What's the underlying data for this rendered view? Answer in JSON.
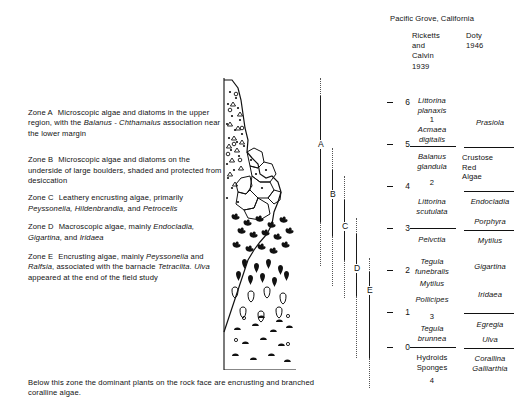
{
  "figure": {
    "footnote": "Below this zone the dominant plants on the rock face are encrusting and branched coralline algae."
  },
  "zones": {
    "items": [
      {
        "tag": "Zone A",
        "parts": [
          {
            "t": "Microscopic algae and diatoms in the upper region, with the ",
            "i": false
          },
          {
            "t": "Balanus - Chthamalus",
            "i": true
          },
          {
            "t": " association near the lower margin",
            "i": false
          }
        ]
      },
      {
        "tag": "Zone B",
        "parts": [
          {
            "t": "Microscopic algae and diatoms on the underside of large boulders, shaded and protected from desiccation",
            "i": false
          }
        ]
      },
      {
        "tag": "Zone C",
        "parts": [
          {
            "t": "Leathery encrusting algae, primarily ",
            "i": false
          },
          {
            "t": "Peyssonelia, Hildenbrandia,",
            "i": true
          },
          {
            "t": " and ",
            "i": false
          },
          {
            "t": "Petrocelis",
            "i": true
          }
        ]
      },
      {
        "tag": "Zone D",
        "parts": [
          {
            "t": "Macroscopic algae, mainly ",
            "i": false
          },
          {
            "t": "Endocladia, Gigartina,",
            "i": true
          },
          {
            "t": " and ",
            "i": false
          },
          {
            "t": "Iridaea",
            "i": true
          }
        ]
      },
      {
        "tag": "Zone E",
        "parts": [
          {
            "t": "Encrusting algae, mainly ",
            "i": false
          },
          {
            "t": "Peyssonelia",
            "i": true
          },
          {
            "t": " and ",
            "i": false
          },
          {
            "t": "Ralfsia",
            "i": true
          },
          {
            "t": ", associated with the barnacle ",
            "i": false
          },
          {
            "t": "Tetraclita. Ulva",
            "i": true
          },
          {
            "t": " appeared at the end of the field study",
            "i": false
          }
        ]
      }
    ]
  },
  "bars": {
    "labels": [
      "A",
      "B",
      "C",
      "D",
      "E"
    ]
  },
  "panel": {
    "title": "Pacific Grove, California",
    "column_a_header": "Ricketts\nand\nCalvin\n1939",
    "column_b_header": "Doty\n1946",
    "column_a_header_lines": [
      "Ricketts",
      "and",
      "Calvin",
      "1939"
    ],
    "column_b_header_lines": [
      "Doty",
      "1946"
    ],
    "scale_labels": [
      "6",
      "5",
      "4",
      "3",
      "2",
      "1",
      "0"
    ],
    "column_a_entries": [
      {
        "text": "Littorina\nplanaxis",
        "italic": true
      },
      {
        "text": "1",
        "italic": false
      },
      {
        "text": "Acmaea\ndigitalis",
        "italic": true
      },
      {
        "text": "Balanus\nglandula",
        "italic": true
      },
      {
        "text": "2",
        "italic": false
      },
      {
        "text": "Littorina\nscutulata",
        "italic": true
      },
      {
        "text": "Pelvctia",
        "italic": true
      },
      {
        "text": "Tegula\nfunebralis",
        "italic": true
      },
      {
        "text": "Mytilus",
        "italic": true
      },
      {
        "text": "Pollicipes",
        "italic": true
      },
      {
        "text": "3",
        "italic": false
      },
      {
        "text": "Tegula\nbrunnea",
        "italic": true
      },
      {
        "text": "Hydroids\nSponges",
        "italic": false
      },
      {
        "text": "4",
        "italic": false
      }
    ],
    "column_b_entries": [
      {
        "text": "Prasiola",
        "italic": true
      },
      {
        "text": "Crustose\nRed\nAlgae",
        "italic": false
      },
      {
        "text": "Endocladia",
        "italic": true
      },
      {
        "text": "Porphyra",
        "italic": true
      },
      {
        "text": "Mytilus",
        "italic": true
      },
      {
        "text": "Gigartina",
        "italic": true
      },
      {
        "text": "Iridaea",
        "italic": true
      },
      {
        "text": "Egregia",
        "italic": true
      },
      {
        "text": "Ulva",
        "italic": true
      },
      {
        "text": "Corallina\nGalliarthia",
        "italic": true
      }
    ]
  },
  "colors": {
    "ink": "#111111",
    "background": "#ffffff",
    "dotted": "#555555"
  }
}
